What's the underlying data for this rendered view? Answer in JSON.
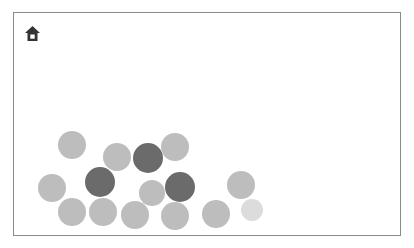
{
  "game": {
    "home_icon": "home-icon",
    "colors": {
      "border": "#8a8a8a",
      "icon": "#333333",
      "light": "#bdbdbd",
      "dark": "#6b6b6b",
      "faint": "#dcdcdc"
    },
    "balls": [
      {
        "x": 72,
        "y": 145,
        "r": 14,
        "shade": "light"
      },
      {
        "x": 117,
        "y": 157,
        "r": 14,
        "shade": "light"
      },
      {
        "x": 148,
        "y": 158,
        "r": 15,
        "shade": "dark"
      },
      {
        "x": 175,
        "y": 147,
        "r": 14,
        "shade": "light"
      },
      {
        "x": 52,
        "y": 188,
        "r": 14,
        "shade": "light"
      },
      {
        "x": 100,
        "y": 182,
        "r": 15,
        "shade": "dark"
      },
      {
        "x": 152,
        "y": 193,
        "r": 13,
        "shade": "light"
      },
      {
        "x": 180,
        "y": 187,
        "r": 15,
        "shade": "dark"
      },
      {
        "x": 241,
        "y": 185,
        "r": 14,
        "shade": "light"
      },
      {
        "x": 72,
        "y": 212,
        "r": 14,
        "shade": "light"
      },
      {
        "x": 103,
        "y": 212,
        "r": 14,
        "shade": "light"
      },
      {
        "x": 135,
        "y": 215,
        "r": 14,
        "shade": "light"
      },
      {
        "x": 175,
        "y": 216,
        "r": 14,
        "shade": "light"
      },
      {
        "x": 216,
        "y": 214,
        "r": 14,
        "shade": "light"
      },
      {
        "x": 252,
        "y": 210,
        "r": 11,
        "shade": "faint"
      }
    ]
  }
}
